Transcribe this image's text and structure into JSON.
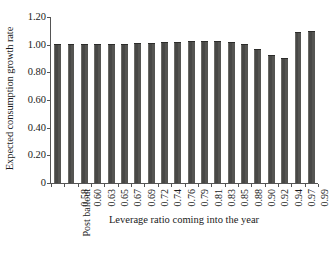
{
  "chart_data": {
    "type": "bar",
    "title": "",
    "xlabel": "Leverage ratio coming into the year",
    "ylabel": "Expected consumption growth rate",
    "categories": [
      "Post bailout",
      "0.58",
      "0.60",
      "0.63",
      "0.65",
      "0.67",
      "0.69",
      "0.72",
      "0.74",
      "0.76",
      "0.79",
      "0.81",
      "0.83",
      "0.85",
      "0.88",
      "0.90",
      "0.92",
      "0.94",
      "0.97",
      "0.99"
    ],
    "values": [
      1.0,
      1.0,
      1.0,
      1.0,
      1.0,
      1.0,
      1.005,
      1.007,
      1.01,
      1.015,
      1.02,
      1.02,
      1.02,
      1.01,
      0.995,
      0.965,
      0.92,
      0.897,
      1.085,
      1.09
    ],
    "ylim": [
      0,
      1.2
    ],
    "ytick_labels": [
      "0",
      "0.20",
      "0.40",
      "0.60",
      "0.80",
      "1.00",
      "1.20"
    ],
    "ytick_values": [
      0,
      0.2,
      0.4,
      0.6,
      0.8,
      1.0,
      1.2
    ],
    "grid": false,
    "legend": "none",
    "bar_color": "#4d4d4b",
    "axis_color": "#555555",
    "background": "#ffffff"
  }
}
